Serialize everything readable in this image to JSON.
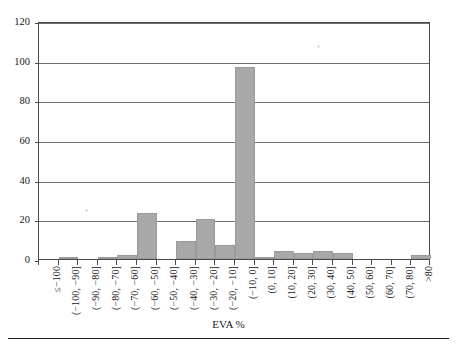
{
  "chart_data": {
    "type": "bar",
    "title": "",
    "subtitle": "",
    "xlabel": "EVA %",
    "ylabel": "",
    "categories": [
      "≤−100",
      "(−100, −90]",
      "(−90, −80]",
      "(−80, −70]",
      "(−70, −60]",
      "(−60, −50]",
      "(−50, −40]",
      "(−40, −30]",
      "(−30, −20]",
      "(−20, −10]",
      "(−10, 0]",
      "(0, 10]",
      "(10, 20]",
      "(20, 30]",
      "(30, 40]",
      "(40, 50]",
      "(50, 60]",
      "(60, 70]",
      "(70, 80]",
      ">80"
    ],
    "values": [
      0,
      1,
      0,
      1,
      2,
      23,
      0,
      9,
      20,
      7,
      97,
      1,
      4,
      3,
      4,
      3,
      0,
      0,
      0,
      2
    ],
    "ylim": [
      0,
      120
    ],
    "yticks": [
      0,
      20,
      40,
      60,
      80,
      100,
      120
    ],
    "ytick_labels": [
      "0",
      "20",
      "40",
      "60",
      "80",
      "100",
      "120"
    ],
    "grid": "horizontal",
    "legend": "none",
    "bar_color": "#a8a8a8",
    "axis_color": "#4a4a4a",
    "grid_color": "#6e6e6e"
  }
}
